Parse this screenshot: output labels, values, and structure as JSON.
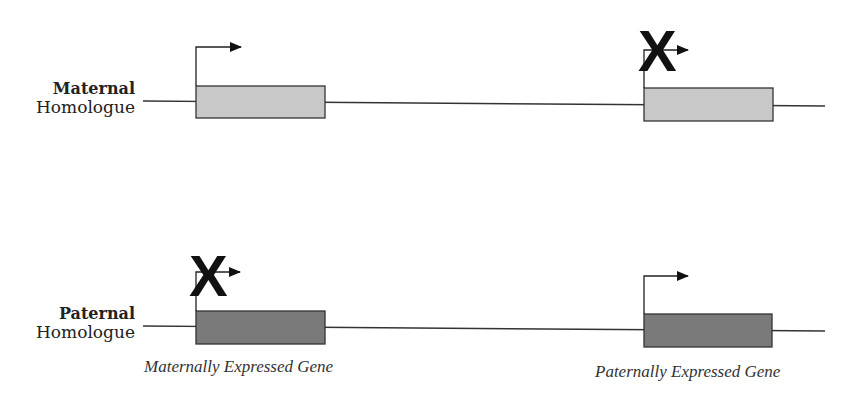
{
  "diagram": {
    "rows": [
      {
        "id": "maternal",
        "label_bold": "Maternal",
        "label_normal": "Homologue"
      },
      {
        "id": "paternal",
        "label_bold": "Paternal",
        "label_normal": "Homologue"
      }
    ],
    "captions": {
      "left_gene": "Maternally Expressed Gene",
      "right_gene": "Paternally Expressed Gene"
    },
    "silenced_mark": "X",
    "colors": {
      "maternal_box": "#c8c8c8",
      "paternal_box": "#7a7a7a",
      "line": "#333333"
    },
    "genes": [
      {
        "row": "maternal",
        "position": "left",
        "expressed": true
      },
      {
        "row": "maternal",
        "position": "right",
        "expressed": false
      },
      {
        "row": "paternal",
        "position": "left",
        "expressed": false
      },
      {
        "row": "paternal",
        "position": "right",
        "expressed": true
      }
    ]
  }
}
